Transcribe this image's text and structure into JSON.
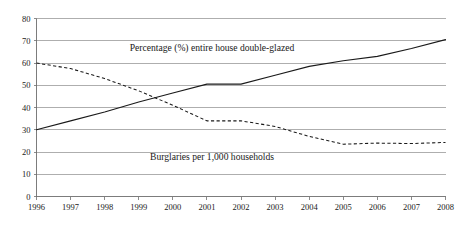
{
  "chart_data": {
    "type": "line",
    "title": "",
    "subtitle": "",
    "xlabel": "",
    "ylabel": "",
    "grid": "horizontal",
    "legend_position": "inline-annotation",
    "xlim": [
      1996,
      2008
    ],
    "ylim": [
      0,
      80
    ],
    "x": [
      1996,
      1997,
      1998,
      1999,
      2000,
      2001,
      2002,
      2003,
      2004,
      2005,
      2006,
      2007,
      2008
    ],
    "categories": [
      "1996",
      "1997",
      "1998",
      "1999",
      "2000",
      "2001",
      "2002",
      "2003",
      "2004",
      "2005",
      "2006",
      "2007",
      "2008"
    ],
    "y_ticks": [
      0,
      10,
      20,
      30,
      40,
      50,
      60,
      70,
      80
    ],
    "y_tick_labels": [
      "0",
      "10",
      "20",
      "30",
      "40",
      "50",
      "60",
      "70",
      "80"
    ],
    "series": [
      {
        "name": "Percentage (%) entire house double-glazed",
        "style": "solid",
        "color": "#1a1a1a",
        "values": [
          30,
          34,
          38,
          42.5,
          46.5,
          50.5,
          50.5,
          54.5,
          58.5,
          61,
          63,
          66.5,
          70.5
        ]
      },
      {
        "name": "Burglaries per 1,000 households",
        "style": "dashed",
        "color": "#1a1a1a",
        "values": [
          60,
          57.5,
          53,
          47.5,
          41,
          34,
          34,
          31.5,
          27,
          23.5,
          24,
          23.8,
          24.3
        ]
      }
    ],
    "annotations": [
      {
        "id": "double-glazed-label",
        "text": "Percentage (%) entire house double-glazed",
        "x": 2001.15,
        "y": 65.5
      },
      {
        "id": "burglaries-label",
        "text": "Burglaries per 1,000 households",
        "x": 2001.15,
        "y": 16.5
      }
    ]
  }
}
